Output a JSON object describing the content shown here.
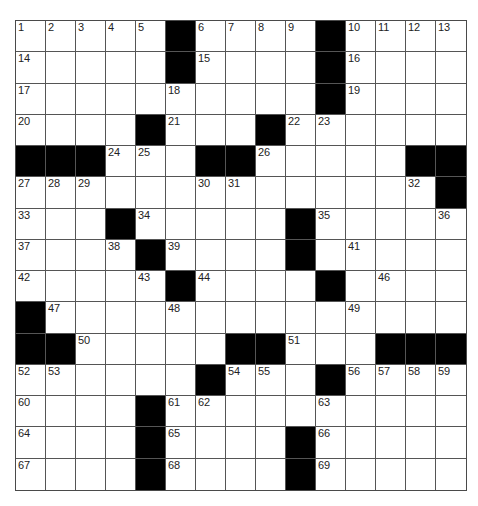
{
  "puzzle": {
    "rows": 15,
    "cols": 15,
    "colors": {
      "block": "#000000",
      "cell": "#ffffff",
      "line": "#555555"
    },
    "layout": [
      ".....#....#....",
      ".....#....#....",
      "..........#....",
      "....#...#......",
      "###...##.....##",
      "..............#",
      "...#.....#.....",
      "....#....#.....",
      ".....#....#....",
      "#..............",
      "##.....##...###",
      "......#...#....",
      "....#..........",
      "....#....#.....",
      "....#....#....."
    ],
    "numbers": [
      {
        "r": 0,
        "c": 0,
        "n": "1"
      },
      {
        "r": 0,
        "c": 1,
        "n": "2"
      },
      {
        "r": 0,
        "c": 2,
        "n": "3"
      },
      {
        "r": 0,
        "c": 3,
        "n": "4"
      },
      {
        "r": 0,
        "c": 4,
        "n": "5"
      },
      {
        "r": 0,
        "c": 6,
        "n": "6"
      },
      {
        "r": 0,
        "c": 7,
        "n": "7"
      },
      {
        "r": 0,
        "c": 8,
        "n": "8"
      },
      {
        "r": 0,
        "c": 9,
        "n": "9"
      },
      {
        "r": 0,
        "c": 11,
        "n": "10"
      },
      {
        "r": 0,
        "c": 12,
        "n": "11"
      },
      {
        "r": 0,
        "c": 13,
        "n": "12"
      },
      {
        "r": 0,
        "c": 14,
        "n": "13"
      },
      {
        "r": 1,
        "c": 0,
        "n": "14"
      },
      {
        "r": 1,
        "c": 6,
        "n": "15"
      },
      {
        "r": 1,
        "c": 11,
        "n": "16"
      },
      {
        "r": 2,
        "c": 0,
        "n": "17"
      },
      {
        "r": 2,
        "c": 5,
        "n": "18"
      },
      {
        "r": 2,
        "c": 11,
        "n": "19"
      },
      {
        "r": 3,
        "c": 0,
        "n": "20"
      },
      {
        "r": 3,
        "c": 5,
        "n": "21"
      },
      {
        "r": 3,
        "c": 9,
        "n": "22"
      },
      {
        "r": 3,
        "c": 10,
        "n": "23"
      },
      {
        "r": 4,
        "c": 3,
        "n": "24"
      },
      {
        "r": 4,
        "c": 4,
        "n": "25"
      },
      {
        "r": 4,
        "c": 8,
        "n": "26"
      },
      {
        "r": 5,
        "c": 0,
        "n": "27"
      },
      {
        "r": 5,
        "c": 1,
        "n": "28"
      },
      {
        "r": 5,
        "c": 2,
        "n": "29"
      },
      {
        "r": 5,
        "c": 6,
        "n": "30"
      },
      {
        "r": 5,
        "c": 7,
        "n": "31"
      },
      {
        "r": 5,
        "c": 13,
        "n": "32"
      },
      {
        "r": 6,
        "c": 0,
        "n": "33"
      },
      {
        "r": 6,
        "c": 4,
        "n": "34"
      },
      {
        "r": 6,
        "c": 10,
        "n": "35"
      },
      {
        "r": 6,
        "c": 14,
        "n": "36"
      },
      {
        "r": 7,
        "c": 0,
        "n": "37"
      },
      {
        "r": 7,
        "c": 3,
        "n": "38"
      },
      {
        "r": 7,
        "c": 5,
        "n": "39"
      },
      {
        "r": 7,
        "c": 9,
        "n": "40"
      },
      {
        "r": 7,
        "c": 11,
        "n": "41"
      },
      {
        "r": 8,
        "c": 0,
        "n": "42"
      },
      {
        "r": 8,
        "c": 4,
        "n": "43"
      },
      {
        "r": 8,
        "c": 6,
        "n": "44"
      },
      {
        "r": 8,
        "c": 10,
        "n": "45"
      },
      {
        "r": 8,
        "c": 12,
        "n": "46"
      },
      {
        "r": 9,
        "c": 1,
        "n": "47"
      },
      {
        "r": 9,
        "c": 5,
        "n": "48"
      },
      {
        "r": 9,
        "c": 11,
        "n": "49"
      },
      {
        "r": 10,
        "c": 2,
        "n": "50"
      },
      {
        "r": 10,
        "c": 9,
        "n": "51"
      },
      {
        "r": 11,
        "c": 0,
        "n": "52"
      },
      {
        "r": 11,
        "c": 1,
        "n": "53"
      },
      {
        "r": 11,
        "c": 7,
        "n": "54"
      },
      {
        "r": 11,
        "c": 8,
        "n": "55"
      },
      {
        "r": 11,
        "c": 11,
        "n": "56"
      },
      {
        "r": 11,
        "c": 12,
        "n": "57"
      },
      {
        "r": 11,
        "c": 13,
        "n": "58"
      },
      {
        "r": 11,
        "c": 14,
        "n": "59"
      },
      {
        "r": 12,
        "c": 0,
        "n": "60"
      },
      {
        "r": 12,
        "c": 5,
        "n": "61"
      },
      {
        "r": 12,
        "c": 6,
        "n": "62"
      },
      {
        "r": 12,
        "c": 10,
        "n": "63"
      },
      {
        "r": 13,
        "c": 0,
        "n": "64"
      },
      {
        "r": 13,
        "c": 5,
        "n": "65"
      },
      {
        "r": 13,
        "c": 10,
        "n": "66"
      },
      {
        "r": 14,
        "c": 0,
        "n": "67"
      },
      {
        "r": 14,
        "c": 5,
        "n": "68"
      },
      {
        "r": 14,
        "c": 10,
        "n": "69"
      }
    ]
  }
}
